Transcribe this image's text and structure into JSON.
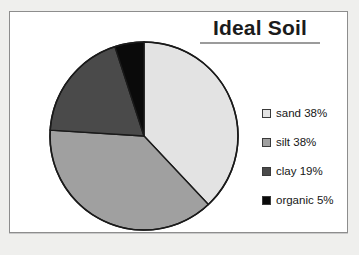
{
  "chart_data": {
    "type": "pie",
    "title": "Ideal Soil",
    "categories": [
      "sand",
      "silt",
      "clay",
      "organic"
    ],
    "values": [
      38,
      38,
      19,
      5
    ],
    "value_unit": "%",
    "labels": [
      "sand 38%",
      "silt 38%",
      "clay 19%",
      "organic 5%"
    ],
    "colors": [
      "#e3e3e3",
      "#a0a0a0",
      "#4a4a4a",
      "#0a0a0a"
    ],
    "start_angle_deg": 0,
    "direction": "clockwise",
    "legend_position": "right",
    "grid": false,
    "slice_outline_color": "#1a1a1a",
    "xlabel": "",
    "ylabel": ""
  },
  "title": {
    "text": "Ideal Soil"
  },
  "legend": {
    "items": [
      {
        "label": "sand 38%",
        "name": "sand",
        "value": 38,
        "color": "#e3e3e3"
      },
      {
        "label": "silt 38%",
        "name": "silt",
        "value": 38,
        "color": "#a0a0a0"
      },
      {
        "label": "clay 19%",
        "name": "clay",
        "value": 19,
        "color": "#4a4a4a"
      },
      {
        "label": "organic 5%",
        "name": "organic",
        "value": 5,
        "color": "#0a0a0a"
      }
    ]
  },
  "frame": {
    "border_color": "#8d8d8d",
    "background": "#ffffff"
  }
}
